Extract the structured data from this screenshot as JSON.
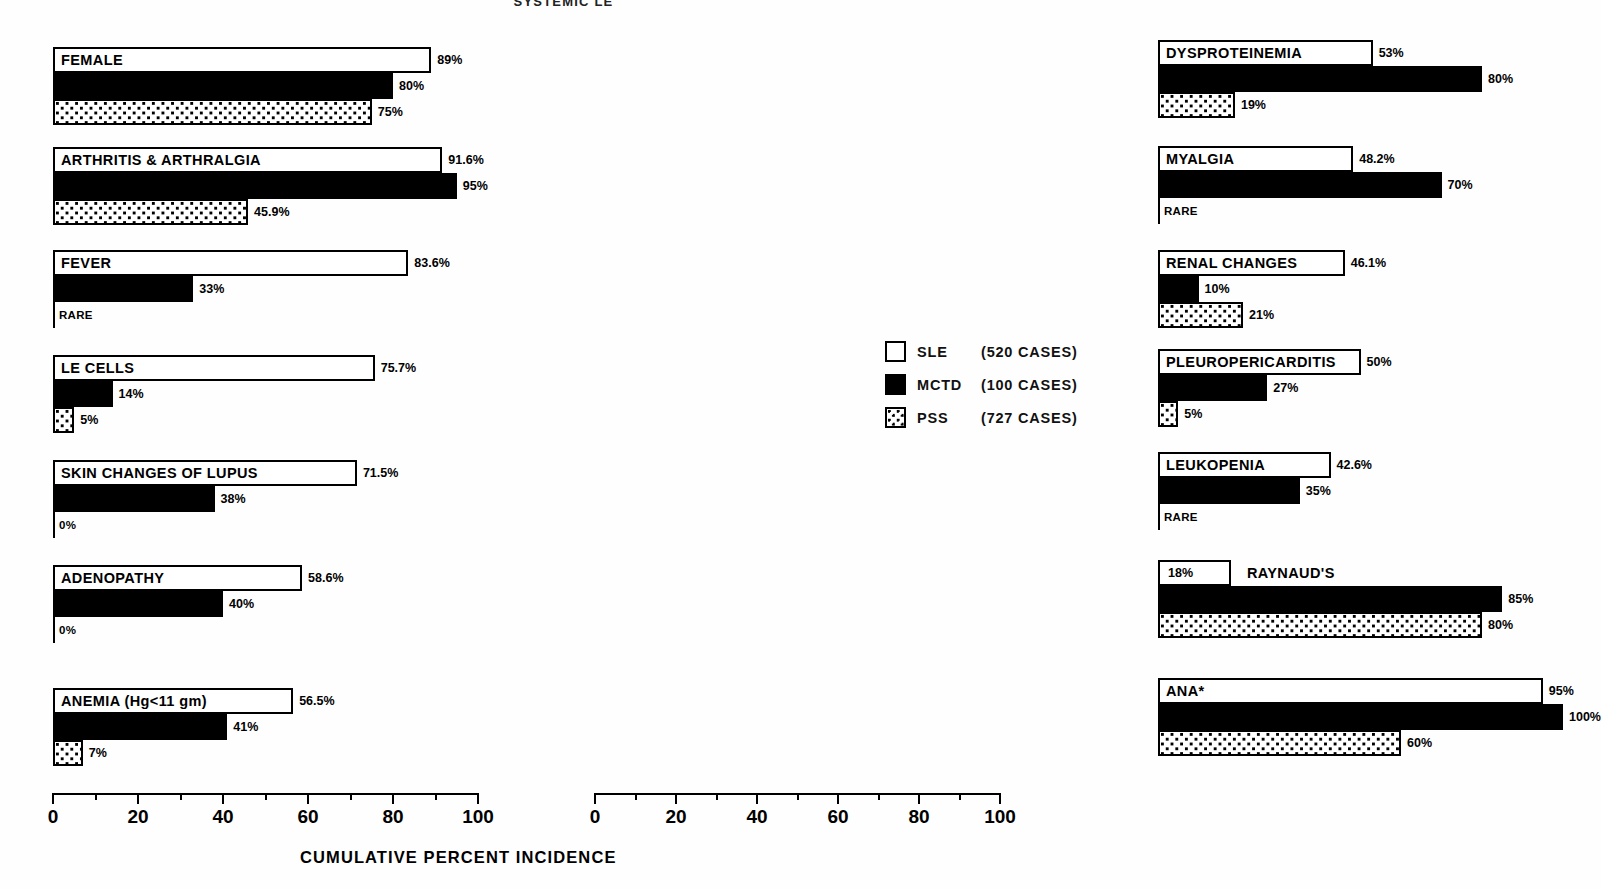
{
  "title": "SYSTEMIC LE",
  "axis": {
    "caption": "CUMULATIVE PERCENT INCIDENCE",
    "ticks": [
      "0",
      "20",
      "40",
      "60",
      "80",
      "100"
    ],
    "min": 0,
    "max": 100
  },
  "legend": {
    "items": [
      {
        "key": "sle",
        "name": "SLE",
        "cases": "(520 CASES)"
      },
      {
        "key": "mctd",
        "name": "MCTD",
        "cases": "(100 CASES)"
      },
      {
        "key": "pss",
        "name": "PSS",
        "cases": "(727 CASES)"
      }
    ]
  },
  "chart_data": {
    "type": "bar",
    "orientation": "horizontal",
    "title": "SYSTEMIC LE",
    "xlabel": "CUMULATIVE PERCENT INCIDENCE",
    "ylabel": "",
    "xlim": [
      0,
      100
    ],
    "xticks": [
      0,
      20,
      40,
      60,
      80,
      100
    ],
    "grid": false,
    "legend_position": "middle-right",
    "series": [
      {
        "name": "SLE",
        "cases": 520,
        "style": "white-outline"
      },
      {
        "name": "MCTD",
        "cases": 100,
        "style": "solid-black"
      },
      {
        "name": "PSS",
        "cases": 727,
        "style": "dotted"
      }
    ],
    "categories": [
      "FEMALE",
      "ARTHRITIS & ARTHRALGIA",
      "FEVER",
      "LE CELLS",
      "SKIN CHANGES OF LUPUS",
      "ADENOPATHY",
      "ANEMIA  (Hg<11 gm)",
      "DYSPROTEINEMIA",
      "MYALGIA",
      "RENAL CHANGES",
      "PLEUROPERICARDITIS",
      "LEUKOPENIA",
      "RAYNAUD'S",
      "ANA*"
    ],
    "values": {
      "SLE": [
        89,
        91.6,
        83.6,
        75.7,
        71.5,
        58.6,
        56.5,
        53,
        48.2,
        46.1,
        50,
        42.6,
        18,
        95
      ],
      "MCTD": [
        80,
        95,
        33,
        14,
        38,
        40,
        41,
        80,
        70,
        10,
        27,
        35,
        85,
        100
      ],
      "PSS": [
        75,
        45.9,
        0,
        5,
        0,
        0,
        7,
        19,
        0,
        21,
        5,
        0,
        80,
        60
      ]
    },
    "value_labels": {
      "SLE": [
        "89%",
        "91.6%",
        "83.6%",
        "75.7%",
        "71.5%",
        "58.6%",
        "56.5%",
        "53%",
        "48.2%",
        "46.1%",
        "50%",
        "42.6%",
        "18%",
        "95%"
      ],
      "MCTD": [
        "80%",
        "95%",
        "33%",
        "14%",
        "38%",
        "40%",
        "41%",
        "80%",
        "70%",
        "10%",
        "27%",
        "35%",
        "85%",
        "100%"
      ],
      "PSS": [
        "75%",
        "45.9%",
        "RARE",
        "5%",
        "0%",
        "0%",
        "7%",
        "19%",
        "RARE",
        "21%",
        "5%",
        "RARE",
        "80%",
        "60%"
      ]
    }
  },
  "columns": [
    {
      "id": "left",
      "groups": [
        {
          "label": "FEMALE",
          "label_outside": false,
          "bars": [
            {
              "series": "SLE",
              "value": 89,
              "label": "89%"
            },
            {
              "series": "MCTD",
              "value": 80,
              "label": "80%"
            },
            {
              "series": "PSS",
              "value": 75,
              "label": "75%"
            }
          ]
        },
        {
          "label": "ARTHRITIS & ARTHRALGIA",
          "label_outside": false,
          "bars": [
            {
              "series": "SLE",
              "value": 91.6,
              "label": "91.6%"
            },
            {
              "series": "MCTD",
              "value": 95,
              "label": "95%"
            },
            {
              "series": "PSS",
              "value": 45.9,
              "label": "45.9%"
            }
          ]
        },
        {
          "label": "FEVER",
          "label_outside": false,
          "bars": [
            {
              "series": "SLE",
              "value": 83.6,
              "label": "83.6%"
            },
            {
              "series": "MCTD",
              "value": 33,
              "label": "33%"
            },
            {
              "series": "PSS",
              "value": 0,
              "label": "RARE"
            }
          ]
        },
        {
          "label": "LE CELLS",
          "label_outside": false,
          "bars": [
            {
              "series": "SLE",
              "value": 75.7,
              "label": "75.7%"
            },
            {
              "series": "MCTD",
              "value": 14,
              "label": "14%"
            },
            {
              "series": "PSS",
              "value": 5,
              "label": "5%"
            }
          ]
        },
        {
          "label": "SKIN CHANGES OF LUPUS",
          "label_outside": false,
          "bars": [
            {
              "series": "SLE",
              "value": 71.5,
              "label": "71.5%"
            },
            {
              "series": "MCTD",
              "value": 38,
              "label": "38%"
            },
            {
              "series": "PSS",
              "value": 0,
              "label": "0%"
            }
          ]
        },
        {
          "label": "ADENOPATHY",
          "label_outside": false,
          "bars": [
            {
              "series": "SLE",
              "value": 58.6,
              "label": "58.6%"
            },
            {
              "series": "MCTD",
              "value": 40,
              "label": "40%"
            },
            {
              "series": "PSS",
              "value": 0,
              "label": "0%"
            }
          ]
        },
        {
          "label": "ANEMIA  (Hg<11 gm)",
          "label_outside": false,
          "bars": [
            {
              "series": "SLE",
              "value": 56.5,
              "label": "56.5%"
            },
            {
              "series": "MCTD",
              "value": 41,
              "label": "41%"
            },
            {
              "series": "PSS",
              "value": 7,
              "label": "7%"
            }
          ]
        }
      ]
    },
    {
      "id": "right",
      "groups": [
        {
          "label": "DYSPROTEINEMIA",
          "label_outside": false,
          "bars": [
            {
              "series": "SLE",
              "value": 53,
              "label": "53%"
            },
            {
              "series": "MCTD",
              "value": 80,
              "label": "80%"
            },
            {
              "series": "PSS",
              "value": 19,
              "label": "19%"
            }
          ]
        },
        {
          "label": "MYALGIA",
          "label_outside": false,
          "bars": [
            {
              "series": "SLE",
              "value": 48.2,
              "label": "48.2%"
            },
            {
              "series": "MCTD",
              "value": 70,
              "label": "70%"
            },
            {
              "series": "PSS",
              "value": 0,
              "label": "RARE"
            }
          ]
        },
        {
          "label": "RENAL CHANGES",
          "label_outside": false,
          "bars": [
            {
              "series": "SLE",
              "value": 46.1,
              "label": "46.1%"
            },
            {
              "series": "MCTD",
              "value": 10,
              "label": "10%"
            },
            {
              "series": "PSS",
              "value": 21,
              "label": "21%"
            }
          ]
        },
        {
          "label": "PLEUROPERICARDITIS",
          "label_outside": false,
          "bars": [
            {
              "series": "SLE",
              "value": 50,
              "label": "50%"
            },
            {
              "series": "MCTD",
              "value": 27,
              "label": "27%"
            },
            {
              "series": "PSS",
              "value": 5,
              "label": "5%"
            }
          ]
        },
        {
          "label": "LEUKOPENIA",
          "label_outside": false,
          "bars": [
            {
              "series": "SLE",
              "value": 42.6,
              "label": "42.6%"
            },
            {
              "series": "MCTD",
              "value": 35,
              "label": "35%"
            },
            {
              "series": "PSS",
              "value": 0,
              "label": "RARE"
            }
          ]
        },
        {
          "label": "RAYNAUD'S",
          "label_outside": true,
          "bars": [
            {
              "series": "SLE",
              "value": 18,
              "label": "18%",
              "label_inside": true
            },
            {
              "series": "MCTD",
              "value": 85,
              "label": "85%"
            },
            {
              "series": "PSS",
              "value": 80,
              "label": "80%"
            }
          ]
        },
        {
          "label": "ANA*",
          "label_outside": false,
          "bars": [
            {
              "series": "SLE",
              "value": 95,
              "label": "95%"
            },
            {
              "series": "MCTD",
              "value": 100,
              "label": "100%"
            },
            {
              "series": "PSS",
              "value": 60,
              "label": "60%"
            }
          ]
        }
      ]
    }
  ]
}
